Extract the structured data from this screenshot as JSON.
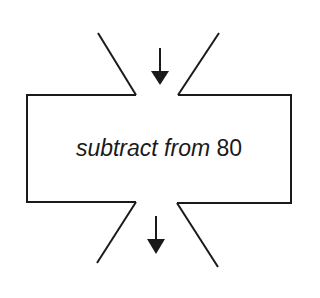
{
  "diagram": {
    "type": "flowchart-process-step",
    "box": {
      "operation_text": "subtract from",
      "operand_text": "80"
    },
    "input_arrow": {
      "icon": "arrow-down-icon",
      "direction": "down"
    },
    "output_arrow": {
      "icon": "arrow-down-icon",
      "direction": "down"
    },
    "colors": {
      "stroke": "#1a1a1a",
      "background": "#ffffff"
    }
  }
}
